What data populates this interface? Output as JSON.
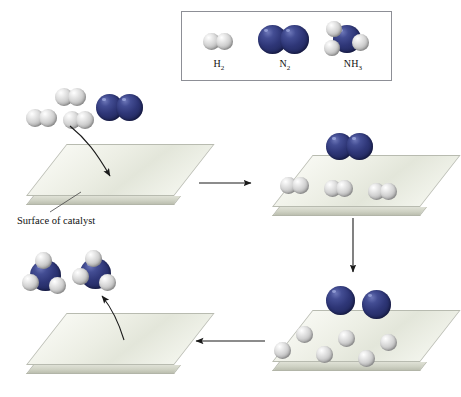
{
  "diagram": {
    "process": "Haber process",
    "surface_label": "Surface of catalyst",
    "colors": {
      "nitrogen": "#2e3677",
      "hydrogen": "#d2d2d2",
      "slab_top": "#eceee4",
      "slab_edge": "#cfd2c4",
      "legend_border": "#8d8f96",
      "arrow": "#1a1a1a",
      "background": "#ffffff"
    }
  },
  "legend": {
    "items": [
      {
        "formula": "H",
        "subscript": "2",
        "name": "hydrogen-molecule",
        "atoms": "2 H"
      },
      {
        "formula": "N",
        "subscript": "2",
        "name": "nitrogen-molecule",
        "atoms": "2 N"
      },
      {
        "formula": "NH",
        "subscript": "3",
        "name": "ammonia-molecule",
        "atoms": "1 N + 3 H"
      }
    ]
  },
  "stages": [
    {
      "id": 1,
      "name": "adsorption",
      "caption": "Surface of catalyst",
      "free_molecules": {
        "h2_count": 3,
        "n2_count": 1
      },
      "surface_molecules": {
        "h2_count": 0,
        "n2_count": 0
      },
      "free_atoms": {
        "h_count": 0,
        "n_count": 0
      }
    },
    {
      "id": 2,
      "name": "binding-to-surface",
      "caption": "",
      "free_molecules": {
        "h2_count": 0,
        "n2_count": 0
      },
      "surface_molecules": {
        "h2_count": 3,
        "n2_count": 1
      },
      "free_atoms": {
        "h_count": 0,
        "n_count": 0
      }
    },
    {
      "id": 3,
      "name": "dissociation",
      "caption": "",
      "free_molecules": {
        "h2_count": 0,
        "n2_count": 0
      },
      "surface_molecules": {
        "h2_count": 0,
        "n2_count": 0
      },
      "free_atoms": {
        "h_count": 6,
        "n_count": 2
      }
    },
    {
      "id": 4,
      "name": "desorption",
      "caption": "",
      "free_molecules": {
        "nh3_count": 2
      },
      "surface_molecules": {
        "h2_count": 0,
        "n2_count": 0
      },
      "free_atoms": {
        "h_count": 0,
        "n_count": 0
      }
    }
  ],
  "arrows": [
    {
      "name": "stage1-to-stage2",
      "direction": "right"
    },
    {
      "name": "stage2-to-stage3",
      "direction": "down"
    },
    {
      "name": "stage3-to-stage4",
      "direction": "left"
    },
    {
      "name": "adsorption-onto-surface",
      "direction": "down-curved"
    },
    {
      "name": "ammonia-release",
      "direction": "up-curved"
    }
  ]
}
